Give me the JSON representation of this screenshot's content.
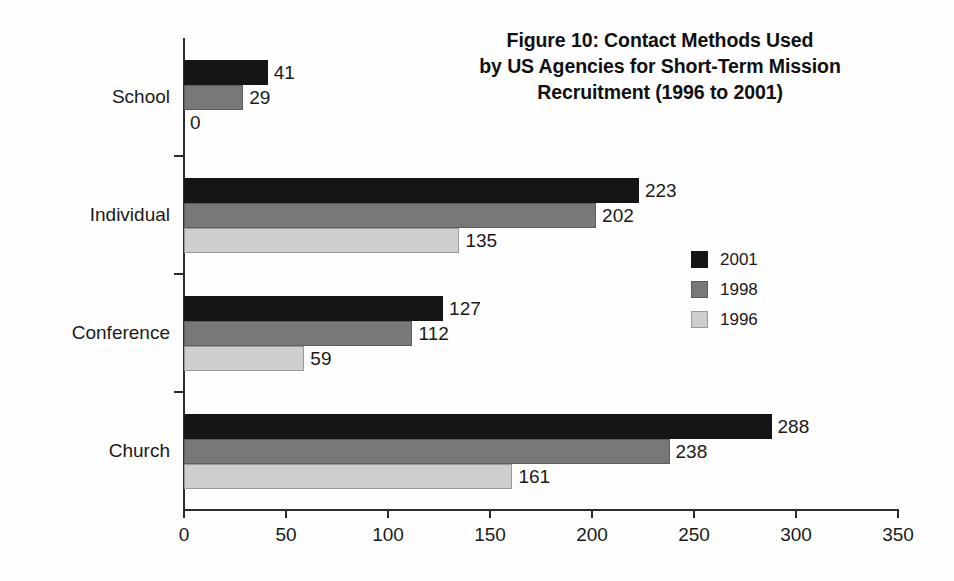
{
  "chart_data": {
    "type": "bar",
    "orientation": "horizontal",
    "title": "Figure 10: Contact Methods Used\nby US Agencies for Short-Term Mission\nRecruitment (1996 to 2001)",
    "xlabel": "",
    "ylabel": "",
    "categories": [
      "School",
      "Individual",
      "Conference",
      "Church"
    ],
    "series": [
      {
        "name": "2001",
        "color": "#151515",
        "values": [
          41,
          223,
          127,
          288
        ]
      },
      {
        "name": "1998",
        "color": "#787878",
        "values": [
          29,
          202,
          112,
          238
        ]
      },
      {
        "name": "1996",
        "color": "#cfcfcf",
        "values": [
          0,
          135,
          59,
          161
        ]
      }
    ],
    "xlim": [
      0,
      350
    ],
    "xticks": [
      0,
      50,
      100,
      150,
      200,
      250,
      300,
      350
    ],
    "xtick_labels": [
      "0",
      "50",
      "100",
      "150",
      "200",
      "250",
      "300",
      "350"
    ],
    "grid": false,
    "legend": {
      "position": "right-middle",
      "entries": [
        "2001",
        "1998",
        "1996"
      ]
    },
    "data_labels": [
      [
        "41",
        "29",
        "0"
      ],
      [
        "223",
        "202",
        "135"
      ],
      [
        "127",
        "112",
        "59"
      ],
      [
        "288",
        "238",
        "161"
      ]
    ]
  }
}
